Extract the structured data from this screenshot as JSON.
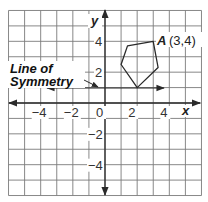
{
  "diagram": {
    "type": "coordinate-grid-reflection",
    "grid": {
      "x_min": -6,
      "x_max": 6,
      "y_min": -6,
      "y_max": 6,
      "cells_x": 12,
      "cells_y": 12
    },
    "axes": {
      "x_label": "x",
      "y_label": "y",
      "x_ticks": [
        {
          "value": -4,
          "label": "−4"
        },
        {
          "value": -2,
          "label": "−2"
        },
        {
          "value": 0,
          "label": "0"
        },
        {
          "value": 2,
          "label": "2"
        },
        {
          "value": 4,
          "label": "4"
        }
      ],
      "y_ticks": [
        {
          "value": 4,
          "label": "4"
        },
        {
          "value": 2,
          "label": "2"
        },
        {
          "value": -2,
          "label": "−2"
        },
        {
          "value": -4,
          "label": "−4"
        }
      ]
    },
    "line_of_symmetry": {
      "label_line1": "Line of",
      "label_line2": "Symmetry",
      "equation": "y = 1",
      "x_from": -3.6,
      "x_to": 3.7
    },
    "polygon": {
      "vertices": [
        [
          3,
          4
        ],
        [
          1.4,
          3.7
        ],
        [
          1,
          2.5
        ],
        [
          2,
          1
        ],
        [
          3.3,
          2.3
        ]
      ],
      "point_label": "A",
      "point_coords": "(3,4)"
    },
    "colors": {
      "grid": "#7a7a7a",
      "lines": "#2a2a2a",
      "background": "#ffffff"
    }
  }
}
